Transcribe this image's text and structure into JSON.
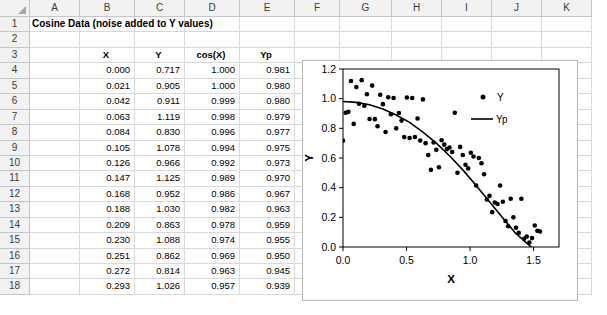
{
  "spreadsheet": {
    "column_headers": [
      "A",
      "B",
      "C",
      "D",
      "E",
      "F",
      "G",
      "H",
      "I",
      "J",
      "K"
    ],
    "row_numbers": [
      "1",
      "2",
      "3",
      "4",
      "5",
      "6",
      "7",
      "8",
      "9",
      "10",
      "11",
      "12",
      "13",
      "14",
      "15",
      "16",
      "17",
      "18"
    ],
    "title_cell": "Cosine Data (noise added to Y values)",
    "table_headers": [
      "X",
      "Y",
      "cos(X)",
      "Yp"
    ],
    "rows": [
      {
        "n": "4",
        "X": "0.000",
        "Y": "0.717",
        "cosX": "1.000",
        "Yp": "0.981"
      },
      {
        "n": "5",
        "X": "0.021",
        "Y": "0.905",
        "cosX": "1.000",
        "Yp": "0.980"
      },
      {
        "n": "6",
        "X": "0.042",
        "Y": "0.911",
        "cosX": "0.999",
        "Yp": "0.980"
      },
      {
        "n": "7",
        "X": "0.063",
        "Y": "1.119",
        "cosX": "0.998",
        "Yp": "0.979"
      },
      {
        "n": "8",
        "X": "0.084",
        "Y": "0.830",
        "cosX": "0.996",
        "Yp": "0.977"
      },
      {
        "n": "9",
        "X": "0.105",
        "Y": "1.078",
        "cosX": "0.994",
        "Yp": "0.975"
      },
      {
        "n": "10",
        "X": "0.126",
        "Y": "0.966",
        "cosX": "0.992",
        "Yp": "0.973"
      },
      {
        "n": "11",
        "X": "0.147",
        "Y": "1.125",
        "cosX": "0.989",
        "Yp": "0.970"
      },
      {
        "n": "12",
        "X": "0.168",
        "Y": "0.952",
        "cosX": "0.986",
        "Yp": "0.967"
      },
      {
        "n": "13",
        "X": "0.188",
        "Y": "1.030",
        "cosX": "0.982",
        "Yp": "0.963"
      },
      {
        "n": "14",
        "X": "0.209",
        "Y": "0.863",
        "cosX": "0.978",
        "Yp": "0.959"
      },
      {
        "n": "15",
        "X": "0.230",
        "Y": "1.088",
        "cosX": "0.974",
        "Yp": "0.955"
      },
      {
        "n": "16",
        "X": "0.251",
        "Y": "0.862",
        "cosX": "0.969",
        "Yp": "0.950"
      },
      {
        "n": "17",
        "X": "0.272",
        "Y": "0.814",
        "cosX": "0.963",
        "Yp": "0.945"
      },
      {
        "n": "18",
        "X": "0.293",
        "Y": "1.026",
        "cosX": "0.957",
        "Yp": "0.939"
      }
    ]
  },
  "chart_data": {
    "type": "scatter",
    "title": "",
    "xlabel": "X",
    "ylabel": "Y",
    "xlim": [
      0.0,
      1.7
    ],
    "ylim": [
      0.0,
      1.2
    ],
    "xticks": [
      "0.0",
      "0.5",
      "1.0",
      "1.5"
    ],
    "xtick_values": [
      0.0,
      0.5,
      1.0,
      1.5
    ],
    "yticks": [
      "0.0",
      "0.2",
      "0.4",
      "0.6",
      "0.8",
      "1.0",
      "1.2"
    ],
    "ytick_values": [
      0.0,
      0.2,
      0.4,
      0.6,
      0.8,
      1.0,
      1.2
    ],
    "grid": false,
    "legend_position": "upper-right",
    "series": [
      {
        "name": "Y",
        "type": "scatter",
        "marker": "circle",
        "color": "#000000",
        "points": [
          [
            0.0,
            0.717
          ],
          [
            0.021,
            0.905
          ],
          [
            0.042,
            0.911
          ],
          [
            0.063,
            1.119
          ],
          [
            0.084,
            0.83
          ],
          [
            0.105,
            1.078
          ],
          [
            0.126,
            0.966
          ],
          [
            0.147,
            1.125
          ],
          [
            0.168,
            0.952
          ],
          [
            0.188,
            1.03
          ],
          [
            0.209,
            0.863
          ],
          [
            0.23,
            1.088
          ],
          [
            0.251,
            0.862
          ],
          [
            0.272,
            0.814
          ],
          [
            0.293,
            1.026
          ],
          [
            0.314,
            0.963
          ],
          [
            0.335,
            0.775
          ],
          [
            0.356,
            1.01
          ],
          [
            0.377,
            0.895
          ],
          [
            0.398,
            1.005
          ],
          [
            0.419,
            0.8
          ],
          [
            0.44,
            0.903
          ],
          [
            0.461,
            0.852
          ],
          [
            0.482,
            0.741
          ],
          [
            0.503,
            1.008
          ],
          [
            0.524,
            0.735
          ],
          [
            0.545,
            1.005
          ],
          [
            0.566,
            0.742
          ],
          [
            0.587,
            0.866
          ],
          [
            0.608,
            0.718
          ],
          [
            0.629,
            0.995
          ],
          [
            0.65,
            0.7
          ],
          [
            0.671,
            0.62
          ],
          [
            0.692,
            0.52
          ],
          [
            0.713,
            0.705
          ],
          [
            0.734,
            0.655
          ],
          [
            0.755,
            0.538
          ],
          [
            0.776,
            0.72
          ],
          [
            0.797,
            0.69
          ],
          [
            0.818,
            0.66
          ],
          [
            0.838,
            0.67
          ],
          [
            0.859,
            0.64
          ],
          [
            0.88,
            0.905
          ],
          [
            0.901,
            0.5
          ],
          [
            0.922,
            0.675
          ],
          [
            0.943,
            0.62
          ],
          [
            0.964,
            0.555
          ],
          [
            0.985,
            0.53
          ],
          [
            1.006,
            0.635
          ],
          [
            1.027,
            0.61
          ],
          [
            1.048,
            0.415
          ],
          [
            1.069,
            0.6
          ],
          [
            1.09,
            0.565
          ],
          [
            1.111,
            0.49
          ],
          [
            1.132,
            0.32
          ],
          [
            1.153,
            0.345
          ],
          [
            1.174,
            0.235
          ],
          [
            1.195,
            0.3
          ],
          [
            1.216,
            0.29
          ],
          [
            1.237,
            0.415
          ],
          [
            1.258,
            0.305
          ],
          [
            1.279,
            0.175
          ],
          [
            1.3,
            0.14
          ],
          [
            1.32,
            0.325
          ],
          [
            1.341,
            0.2
          ],
          [
            1.362,
            0.13
          ],
          [
            1.383,
            0.095
          ],
          [
            1.404,
            0.325
          ],
          [
            1.425,
            0.055
          ],
          [
            1.446,
            0.07
          ],
          [
            1.467,
            0.03
          ],
          [
            1.488,
            0.06
          ],
          [
            1.509,
            0.145
          ],
          [
            1.53,
            0.11
          ],
          [
            1.551,
            0.105
          ]
        ]
      },
      {
        "name": "Yp",
        "type": "line",
        "color": "#000000",
        "points": [
          [
            0.0,
            0.981
          ],
          [
            0.105,
            0.975
          ],
          [
            0.209,
            0.959
          ],
          [
            0.314,
            0.93
          ],
          [
            0.419,
            0.89
          ],
          [
            0.524,
            0.84
          ],
          [
            0.629,
            0.775
          ],
          [
            0.734,
            0.7
          ],
          [
            0.838,
            0.615
          ],
          [
            0.943,
            0.52
          ],
          [
            1.048,
            0.415
          ],
          [
            1.153,
            0.305
          ],
          [
            1.258,
            0.195
          ],
          [
            1.362,
            0.09
          ],
          [
            1.467,
            0.01
          ],
          [
            1.56,
            -0.06
          ]
        ]
      }
    ]
  }
}
